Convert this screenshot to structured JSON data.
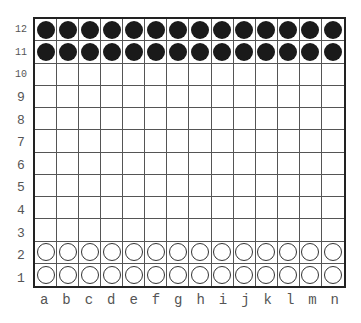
{
  "board": {
    "columns": [
      "a",
      "b",
      "c",
      "d",
      "e",
      "f",
      "g",
      "h",
      "i",
      "j",
      "k",
      "l",
      "m",
      "n"
    ],
    "rows": [
      "12",
      "11",
      "10",
      "9",
      "8",
      "7",
      "6",
      "5",
      "4",
      "3",
      "2",
      "1"
    ],
    "pieces": {
      "black_rows": [
        "12",
        "11"
      ],
      "white_rows": [
        "2",
        "1"
      ]
    },
    "colors": {
      "black_piece": "#1a1a1a",
      "white_piece": "#ffffff",
      "grid_line": "#555555",
      "border": "#222222",
      "label": "#555555"
    }
  }
}
